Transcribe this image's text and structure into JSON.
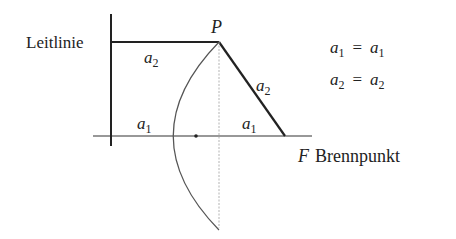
{
  "diagram": {
    "type": "parabola-focus-directrix",
    "labels": {
      "directrix": "Leitlinie",
      "point": "P",
      "focus_symbol": "F",
      "focus_name": "Brennpunkt",
      "a1": "a",
      "a2": "a",
      "sub1": "1",
      "sub2": "2"
    },
    "equations": [
      {
        "lhs": "a",
        "lhs_sub": "1",
        "eq": "=",
        "rhs": "a",
        "rhs_sub": "1"
      },
      {
        "lhs": "a",
        "lhs_sub": "2",
        "eq": "=",
        "rhs": "a",
        "rhs_sub": "2"
      }
    ],
    "colors": {
      "line": "#222222",
      "curve": "#555555",
      "dashed": "#999999"
    }
  }
}
